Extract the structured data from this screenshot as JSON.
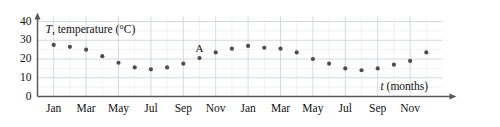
{
  "chart_data": {
    "type": "scatter",
    "title": "",
    "xlabel": "t (months)",
    "ylabel": "T, temperature (°C)",
    "xlim": [
      0,
      25
    ],
    "ylim": [
      0,
      40
    ],
    "grid": true,
    "legend": null,
    "y_ticks": [
      0,
      10,
      20,
      30,
      40
    ],
    "x_ticks": [
      1,
      3,
      5,
      7,
      9,
      11,
      13,
      15,
      17,
      19,
      21,
      23
    ],
    "x_tick_labels": [
      "Jan",
      "Mar",
      "May",
      "Jul",
      "Sep",
      "Nov",
      "Jan",
      "Mar",
      "May",
      "Jul",
      "Sep",
      "Nov"
    ],
    "categories": [
      "Jan",
      "Feb",
      "Mar",
      "Apr",
      "May",
      "Jun",
      "Jul",
      "Aug",
      "Sep",
      "Oct",
      "Nov",
      "Dec",
      "Jan",
      "Feb",
      "Mar",
      "Apr",
      "May",
      "Jun",
      "Jul",
      "Aug",
      "Sep",
      "Oct",
      "Nov",
      "Dec"
    ],
    "x": [
      1,
      2,
      3,
      4,
      5,
      6,
      7,
      8,
      9,
      10,
      11,
      12,
      13,
      14,
      15,
      16,
      17,
      18,
      19,
      20,
      21,
      22,
      23,
      24
    ],
    "values": [
      27.5,
      26.5,
      25,
      21.5,
      18,
      15.5,
      14.5,
      15.5,
      17.5,
      20.5,
      23.5,
      25.5,
      27,
      26,
      25.5,
      23.5,
      20,
      17.5,
      15,
      14,
      15,
      17,
      19,
      23.5
    ],
    "series": [
      {
        "name": "temperature",
        "color": "#4d4d52",
        "values": [
          27.5,
          26.5,
          25,
          21.5,
          18,
          15.5,
          14.5,
          15.5,
          17.5,
          20.5,
          23.5,
          25.5,
          27,
          26,
          25.5,
          23.5,
          20,
          17.5,
          15,
          14,
          15,
          17,
          19,
          23.5
        ]
      }
    ],
    "annotations": [
      {
        "label": "A",
        "x": 10,
        "y": 20.5
      }
    ]
  },
  "style": {
    "grid_color": "#c9cedd",
    "axis_color": "#59595e",
    "point_color": "#4d4d52",
    "text_color": "#111111",
    "background": "#ffffff"
  }
}
